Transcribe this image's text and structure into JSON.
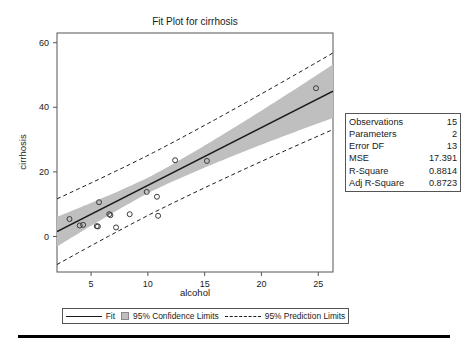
{
  "chart_data": {
    "type": "scatter",
    "title": "Fit Plot for cirrhosis",
    "xlabel": "alcohol",
    "ylabel": "cirrhosis",
    "xlim": [
      2.0,
      26.3
    ],
    "ylim": [
      -11.0,
      63.0
    ],
    "xticks": [
      5,
      10,
      15,
      20,
      25
    ],
    "yticks": [
      0,
      20,
      40,
      60
    ],
    "grid": false,
    "legend_position": "bottom",
    "points": [
      {
        "x": 3.1,
        "y": 5.4
      },
      {
        "x": 4.0,
        "y": 3.4
      },
      {
        "x": 4.3,
        "y": 3.6
      },
      {
        "x": 5.5,
        "y": 3.2
      },
      {
        "x": 5.6,
        "y": 3.1
      },
      {
        "x": 5.7,
        "y": 10.6
      },
      {
        "x": 6.6,
        "y": 6.9
      },
      {
        "x": 6.7,
        "y": 6.6
      },
      {
        "x": 7.2,
        "y": 2.8
      },
      {
        "x": 8.4,
        "y": 6.9
      },
      {
        "x": 9.9,
        "y": 13.8
      },
      {
        "x": 10.8,
        "y": 12.3
      },
      {
        "x": 10.9,
        "y": 6.4
      },
      {
        "x": 12.4,
        "y": 23.6
      },
      {
        "x": 15.2,
        "y": 23.4
      },
      {
        "x": 24.8,
        "y": 45.9
      }
    ],
    "fit_line": {
      "intercept": -2.1,
      "slope": 1.79
    },
    "confidence_band_level": "95%",
    "prediction_band_level": "95%",
    "colors": {
      "fit_line": "#1a1a1a",
      "confidence_band": "#bfbfbf",
      "prediction_limits": "#1a1a1a",
      "marker": "#3a3a3a",
      "axis": "#555555"
    }
  },
  "stats_box": {
    "rows": [
      {
        "label": "Observations",
        "value": "15"
      },
      {
        "label": "Parameters",
        "value": "2"
      },
      {
        "label": "Error DF",
        "value": "13"
      },
      {
        "label": "MSE",
        "value": "17.391"
      },
      {
        "label": "R-Square",
        "value": "0.8814"
      },
      {
        "label": "Adj R-Square",
        "value": "0.8723"
      }
    ]
  },
  "legend": {
    "fit_label": "Fit",
    "confidence_label": "95% Confidence Limits",
    "prediction_label": "95% Prediction Limits"
  }
}
